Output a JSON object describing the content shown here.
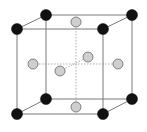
{
  "diagram": {
    "colors": {
      "corner_atom": "#111111",
      "face_atom": "#cfcfcf",
      "edge": "#7a7a7a",
      "guide": "#9a9a9a",
      "background": "#ffffff"
    },
    "corner_atoms": [
      {
        "id": "front-top-left"
      },
      {
        "id": "front-top-right"
      },
      {
        "id": "front-bottom-left"
      },
      {
        "id": "front-bottom-right"
      },
      {
        "id": "back-top-left"
      },
      {
        "id": "back-top-right"
      },
      {
        "id": "back-bottom-left"
      },
      {
        "id": "back-bottom-right"
      }
    ],
    "face_atoms": [
      {
        "id": "top"
      },
      {
        "id": "bottom"
      },
      {
        "id": "left"
      },
      {
        "id": "right"
      },
      {
        "id": "front"
      },
      {
        "id": "back"
      }
    ]
  }
}
